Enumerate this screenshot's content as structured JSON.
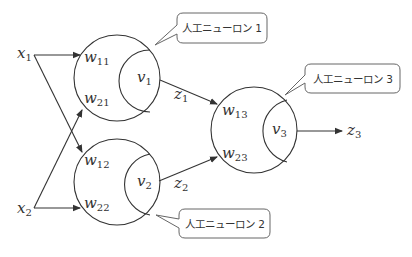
{
  "diagram": {
    "type": "neural-network",
    "colors": {
      "line": "#333333",
      "callout_border": "#666666",
      "background": "#ffffff"
    },
    "inputs": [
      {
        "id": "x1",
        "symbol": "x",
        "subscript": "1"
      },
      {
        "id": "x2",
        "symbol": "x",
        "subscript": "2"
      }
    ],
    "neurons": [
      {
        "id": "neuron1",
        "callout": "人工ニューロン 1",
        "weights": [
          {
            "symbol": "w",
            "subscript": "11"
          },
          {
            "symbol": "w",
            "subscript": "21"
          }
        ],
        "activation": {
          "symbol": "v",
          "subscript": "1"
        },
        "output": {
          "symbol": "z",
          "subscript": "1"
        }
      },
      {
        "id": "neuron2",
        "callout": "人工ニューロン 2",
        "weights": [
          {
            "symbol": "w",
            "subscript": "12"
          },
          {
            "symbol": "w",
            "subscript": "22"
          }
        ],
        "activation": {
          "symbol": "v",
          "subscript": "2"
        },
        "output": {
          "symbol": "z",
          "subscript": "2"
        }
      },
      {
        "id": "neuron3",
        "callout": "人工ニューロン 3",
        "weights": [
          {
            "symbol": "w",
            "subscript": "13"
          },
          {
            "symbol": "w",
            "subscript": "23"
          }
        ],
        "activation": {
          "symbol": "v",
          "subscript": "3"
        },
        "output": {
          "symbol": "z",
          "subscript": "3"
        }
      }
    ]
  }
}
